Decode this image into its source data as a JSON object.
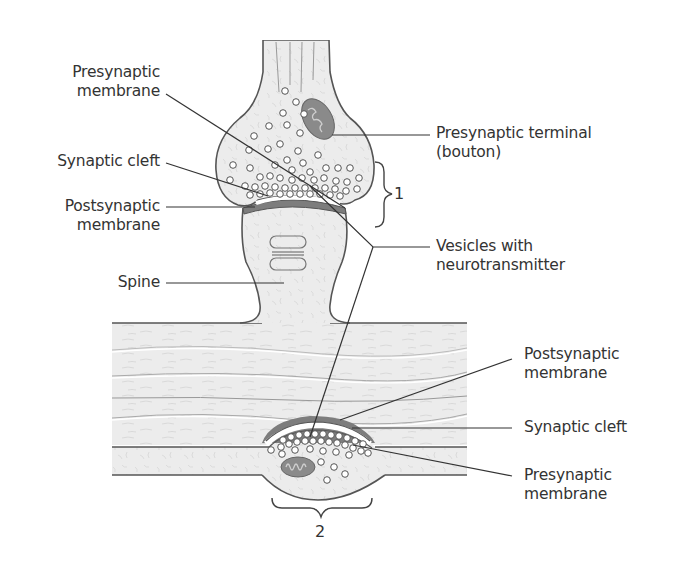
{
  "diagram": {
    "type": "anatomical-illustration",
    "colors": {
      "tissue_fill": "#ededed",
      "outline": "#555555",
      "membrane_dark": "#7d7d7d",
      "mitochondrion": "#8a8a8a",
      "leader_line": "#333333",
      "text": "#333333"
    }
  },
  "labels": {
    "left": {
      "presynaptic_membrane": {
        "line1": "Presynaptic",
        "line2": "membrane"
      },
      "synaptic_cleft": "Synaptic cleft",
      "postsynaptic_membrane": {
        "line1": "Postsynaptic",
        "line2": "membrane"
      },
      "spine": "Spine"
    },
    "right_top": {
      "presynaptic_terminal": {
        "line1": "Presynaptic terminal",
        "line2": "(bouton)"
      },
      "vesicles": {
        "line1": "Vesicles with",
        "line2": "neurotransmitter"
      }
    },
    "right_bottom": {
      "postsynaptic_membrane": {
        "line1": "Postsynaptic",
        "line2": "membrane"
      },
      "synaptic_cleft": "Synaptic cleft",
      "presynaptic_membrane": {
        "line1": "Presynaptic",
        "line2": "membrane"
      }
    },
    "brackets": {
      "one": "1",
      "two": "2"
    }
  }
}
